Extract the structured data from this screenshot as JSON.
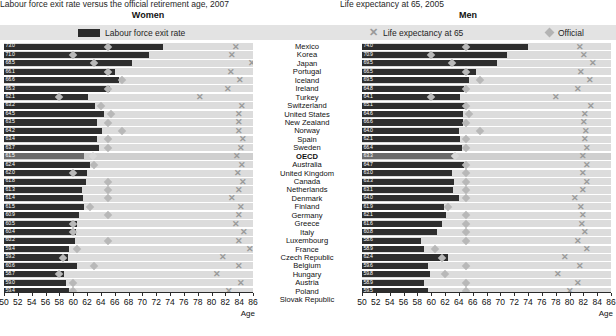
{
  "titles": {
    "left": "Labour force exit rate versus the official retirement age, 2007",
    "right": "Life expectancy at 65, 2005",
    "left_sub": "Women",
    "right_sub": "Men"
  },
  "legend": {
    "bar": "Labour force exit rate",
    "x": "Life expectancy at 65",
    "diamond": "Official"
  },
  "axis": {
    "label": "Age",
    "ticks": [
      50,
      52,
      54,
      56,
      58,
      60,
      62,
      64,
      66,
      68,
      70,
      72,
      74,
      76,
      78,
      80,
      82,
      84,
      86
    ],
    "min": 50,
    "max": 86
  },
  "colors": {
    "bar": "#2e2e2e",
    "bar_oecd": "#6b6b6b",
    "band": "#dcdcdc",
    "diamond": "#b8b8b8",
    "xmark": "#9a9a9a",
    "legend_bg": "#e3e3e3"
  },
  "chart_data": {
    "type": "bar",
    "xlabel": "Age",
    "ylabel": "",
    "xlim": [
      50,
      86
    ],
    "grid": true,
    "legend_position": "top",
    "categories": [
      "Mexico",
      "Korea",
      "Japan",
      "Portugal",
      "Iceland",
      "Ireland",
      "Turkey",
      "Switzerland",
      "United States",
      "New Zealand",
      "Norway",
      "Spain",
      "Sweden",
      "OECD",
      "Australia",
      "United Kingdom",
      "Canada",
      "Netherlands",
      "Denmark",
      "Finland",
      "Germany",
      "Greece",
      "Italy",
      "Luxembourg",
      "France",
      "Czech Republic",
      "Belgium",
      "Hungary",
      "Austria",
      "Poland",
      "Slovak Republic"
    ],
    "panels": [
      {
        "name": "Women",
        "series": [
          {
            "name": "Labour force exit rate",
            "values": [
              73.0,
              71.0,
              68.5,
              66.1,
              66.6,
              65.3,
              62.1,
              63.2,
              64.5,
              63.5,
              64.2,
              63.4,
              63.7,
              61.5,
              62.4,
              62.0,
              62.0,
              61.3,
              61.4,
              61.5,
              60.9,
              60.5,
              60.4,
              60.2,
              60.2,
              58.2,
              60.2,
              58.6,
              59.7,
              58.0,
              55.4,
              55.3
            ]
          },
          {
            "name": "Official",
            "values": [
              65.0,
              60.0,
              63.0,
              65.0,
              67.0,
              65.0,
              58.0,
              64.0,
              65.5,
              65.0,
              67.0,
              65.0,
              65.0,
              62.8,
              63.0,
              60.0,
              65.0,
              65.0,
              65.0,
              62.5,
              65.0,
              60.0,
              60.0,
              65.0,
              60.5,
              58.5,
              63.0,
              62.0,
              60.0,
              60.0,
              57.0
            ]
          },
          {
            "name": "Life expectancy at 65",
            "values": [
              83.5,
              84.6,
              88.4,
              83.5,
              85.1,
              82.5,
              79.8,
              86.0,
              84.7,
              85.0,
              85.2,
              85.4,
              85.5,
              84.7,
              85.2,
              84.5,
              85.3,
              84.9,
              83.6,
              85.0,
              84.8,
              84.5,
              85.4,
              84.5,
              86.1,
              82.6,
              84.7,
              81.9,
              85.0,
              83.2,
              82.3
            ]
          }
        ]
      },
      {
        "name": "Men",
        "series": [
          {
            "name": "Labour force exit rate",
            "values": [
              74.0,
              70.9,
              69.5,
              66.5,
              69.5,
              64.8,
              64.1,
              65.1,
              64.6,
              66.6,
              64.0,
              62.1,
              66.4,
              63.3,
              64.7,
              63.0,
              63.3,
              63.1,
              64.0,
              61.9,
              62.1,
              61.6,
              61.1,
              57.7,
              58.9,
              62.4,
              61.6,
              59.8,
              58.9,
              58.5,
              59.5,
              57.5,
              55.0,
              59.1
            ]
          },
          {
            "name": "Official",
            "values": [
              65.0,
              60.0,
              63.0,
              65.0,
              67.0,
              65.0,
              60.0,
              65.0,
              65.5,
              65.0,
              67.0,
              65.0,
              65.0,
              63.5,
              65.0,
              65.0,
              65.0,
              65.0,
              65.0,
              62.5,
              65.0,
              65.0,
              65.0,
              65.0,
              60.5,
              61.5,
              65.0,
              62.0,
              65.0,
              65.0,
              62.0
            ]
          },
          {
            "name": "Life expectancy at 65",
            "values": [
              81.5,
              82.1,
              83.4,
              81.5,
              83.0,
              81.1,
              78.0,
              83.1,
              82.2,
              82.1,
              82.3,
              82.3,
              82.5,
              81.9,
              82.5,
              81.9,
              82.6,
              81.9,
              80.8,
              81.6,
              81.9,
              81.8,
              82.2,
              81.3,
              82.5,
              79.4,
              81.5,
              78.4,
              81.2,
              80.1,
              79.6
            ]
          }
        ]
      }
    ]
  },
  "rows_women": [
    {
      "country": "Mexico",
      "value": "73.0",
      "bar": 73.0,
      "official": 65.0,
      "life": 83.5
    },
    {
      "country": "Korea",
      "value": "71.0",
      "bar": 71.0,
      "official": 60.0,
      "life": 82.9
    },
    {
      "country": "Japan",
      "value": "68.5",
      "bar": 68.5,
      "official": 63.0,
      "life": 85.8
    },
    {
      "country": "Portugal",
      "value": "66.1",
      "bar": 66.1,
      "official": 65.0,
      "life": 82.8
    },
    {
      "country": "Iceland",
      "value": "66.6",
      "bar": 66.6,
      "official": 67.0,
      "life": 84.1
    },
    {
      "country": "Ireland",
      "value": "65.3",
      "bar": 65.3,
      "official": 65.0,
      "life": 82.4
    },
    {
      "country": "Turkey",
      "value": "62.1",
      "bar": 62.1,
      "official": 58.0,
      "life": 78.4
    },
    {
      "country": "Switzerland",
      "value": "63.2",
      "bar": 63.2,
      "official": 64.0,
      "life": 84.4
    },
    {
      "country": "United States",
      "value": "64.5",
      "bar": 64.5,
      "official": 65.5,
      "life": 84.0
    },
    {
      "country": "New Zealand",
      "value": "63.5",
      "bar": 63.5,
      "official": 65.0,
      "life": 84.0
    },
    {
      "country": "Norway",
      "value": "64.2",
      "bar": 64.2,
      "official": 67.0,
      "life": 84.0
    },
    {
      "country": "Spain",
      "value": "63.4",
      "bar": 63.4,
      "official": 65.0,
      "life": 84.6
    },
    {
      "country": "Sweden",
      "value": "63.7",
      "bar": 63.7,
      "official": 65.0,
      "life": 84.2
    },
    {
      "country": "OECD",
      "value": "61.5",
      "bar": 61.5,
      "official": 62.8,
      "life": 83.7
    },
    {
      "country": "Australia",
      "value": "62.4",
      "bar": 62.4,
      "official": 63.0,
      "life": 84.4
    },
    {
      "country": "United Kingdom",
      "value": "62.0",
      "bar": 62.0,
      "official": 60.0,
      "life": 83.8
    },
    {
      "country": "Canada",
      "value": "61.8",
      "bar": 61.8,
      "official": 65.0,
      "life": 84.5
    },
    {
      "country": "Netherlands",
      "value": "61.3",
      "bar": 61.3,
      "official": 65.0,
      "life": 84.0
    },
    {
      "country": "Denmark",
      "value": "61.4",
      "bar": 61.4,
      "official": 65.0,
      "life": 82.9
    },
    {
      "country": "Finland",
      "value": "61.5",
      "bar": 61.5,
      "official": 62.5,
      "life": 84.2
    },
    {
      "country": "Germany",
      "value": "60.9",
      "bar": 60.9,
      "official": 65.0,
      "life": 84.0
    },
    {
      "country": "Greece",
      "value": "60.5",
      "bar": 60.5,
      "official": 60.0,
      "life": 83.6
    },
    {
      "country": "Italy",
      "value": "60.4",
      "bar": 60.4,
      "official": 60.0,
      "life": 84.7
    },
    {
      "country": "Luxembourg",
      "value": "60.2",
      "bar": 60.2,
      "official": 65.0,
      "life": 84.0
    },
    {
      "country": "France",
      "value": "59.4",
      "bar": 59.4,
      "official": 60.5,
      "life": 85.5
    },
    {
      "country": "Czech Republic",
      "value": "59.2",
      "bar": 59.2,
      "official": 58.5,
      "life": 81.6
    },
    {
      "country": "Belgium",
      "value": "60.6",
      "bar": 60.6,
      "official": 63.0,
      "life": 84.0
    },
    {
      "country": "Hungary",
      "value": "58.7",
      "bar": 58.7,
      "official": 58.0,
      "life": 80.8
    },
    {
      "country": "Austria",
      "value": "59.0",
      "bar": 59.0,
      "official": 60.0,
      "life": 84.2
    },
    {
      "country": "Poland",
      "value": "59.4",
      "bar": 59.4,
      "official": 60.0,
      "life": 82.5
    },
    {
      "country": "Slovak Republic",
      "value": "59.3",
      "bar": 59.3,
      "official": 57.0,
      "life": 81.5
    }
  ],
  "rows_men": [
    {
      "country": "Mexico",
      "value": "74.0",
      "bar": 74.0,
      "official": 65.0,
      "life": 81.5
    },
    {
      "country": "Korea",
      "value": "70.9",
      "bar": 70.9,
      "official": 60.0,
      "life": 82.1
    },
    {
      "country": "Japan",
      "value": "69.5",
      "bar": 69.5,
      "official": 63.0,
      "life": 83.4
    },
    {
      "country": "Portugal",
      "value": "66.5",
      "bar": 66.5,
      "official": 65.0,
      "life": 81.6
    },
    {
      "country": "Iceland",
      "value": "69.5",
      "bar": 65.5,
      "official": 67.0,
      "life": 83.0
    },
    {
      "country": "Ireland",
      "value": "64.8",
      "bar": 64.8,
      "official": 65.0,
      "life": 81.2
    },
    {
      "country": "Turkey",
      "value": "64.1",
      "bar": 64.1,
      "official": 60.0,
      "life": 78.1
    },
    {
      "country": "Switzerland",
      "value": "65.1",
      "bar": 65.1,
      "official": 65.0,
      "life": 83.1
    },
    {
      "country": "United States",
      "value": "64.6",
      "bar": 64.6,
      "official": 65.5,
      "life": 82.2
    },
    {
      "country": "New Zealand",
      "value": "66.6",
      "bar": 64.6,
      "official": 65.0,
      "life": 82.1
    },
    {
      "country": "Norway",
      "value": "64.0",
      "bar": 64.0,
      "official": 67.0,
      "life": 82.4
    },
    {
      "country": "Spain",
      "value": "62.1",
      "bar": 64.1,
      "official": 65.0,
      "life": 82.3
    },
    {
      "country": "Sweden",
      "value": "66.4",
      "bar": 64.4,
      "official": 65.0,
      "life": 82.5
    },
    {
      "country": "OECD",
      "value": "63.3",
      "bar": 63.3,
      "official": 63.5,
      "life": 81.9
    },
    {
      "country": "Australia",
      "value": "64.7",
      "bar": 64.7,
      "official": 65.0,
      "life": 82.5
    },
    {
      "country": "United Kingdom",
      "value": "63.0",
      "bar": 63.0,
      "official": 65.0,
      "life": 81.9
    },
    {
      "country": "Canada",
      "value": "63.3",
      "bar": 63.3,
      "official": 65.0,
      "life": 82.6
    },
    {
      "country": "Netherlands",
      "value": "63.1",
      "bar": 63.1,
      "official": 65.0,
      "life": 81.9
    },
    {
      "country": "Denmark",
      "value": "64.0",
      "bar": 64.0,
      "official": 65.0,
      "life": 80.8
    },
    {
      "country": "Finland",
      "value": "61.9",
      "bar": 61.9,
      "official": 62.5,
      "life": 81.6
    },
    {
      "country": "Germany",
      "value": "62.1",
      "bar": 62.1,
      "official": 65.0,
      "life": 81.9
    },
    {
      "country": "Greece",
      "value": "61.6",
      "bar": 61.6,
      "official": 65.0,
      "life": 81.8
    },
    {
      "country": "Italy",
      "value": "60.8",
      "bar": 60.8,
      "official": 65.0,
      "life": 82.2
    },
    {
      "country": "Luxembourg",
      "value": "58.6",
      "bar": 58.6,
      "official": 65.0,
      "life": 81.3
    },
    {
      "country": "France",
      "value": "58.9",
      "bar": 58.9,
      "official": 60.5,
      "life": 82.5
    },
    {
      "country": "Czech Republic",
      "value": "62.4",
      "bar": 62.4,
      "official": 61.5,
      "life": 79.4
    },
    {
      "country": "Belgium",
      "value": "59.6",
      "bar": 59.6,
      "official": 65.0,
      "life": 81.5
    },
    {
      "country": "Hungary",
      "value": "59.8",
      "bar": 59.8,
      "official": 62.0,
      "life": 78.4
    },
    {
      "country": "Austria",
      "value": "58.9",
      "bar": 58.9,
      "official": 65.0,
      "life": 81.2
    },
    {
      "country": "Poland",
      "value": "59.5",
      "bar": 59.5,
      "official": 65.0,
      "life": 80.1
    },
    {
      "country": "Slovak Republic",
      "value": "55.0",
      "bar": 55.0,
      "official": 62.0,
      "life": 79.6
    }
  ]
}
